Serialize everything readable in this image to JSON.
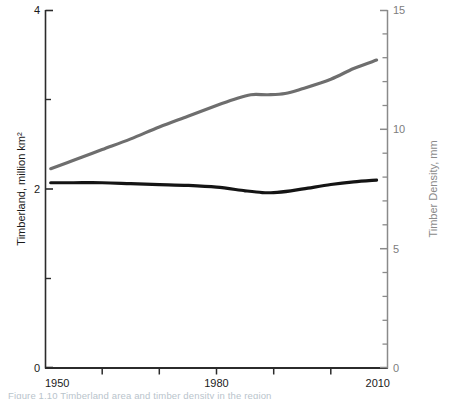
{
  "chart_data": {
    "type": "line",
    "title": "",
    "subtitle": "",
    "xlabel": "",
    "ylabel": "Timberland, million km²",
    "y2label": "Timber Density, mm",
    "xlim": [
      1950,
      2010
    ],
    "ylim": [
      0,
      4
    ],
    "y2lim": [
      0,
      15
    ],
    "grid": false,
    "legend": "none",
    "x_ticks_major": [
      1950,
      1980,
      2010
    ],
    "x_ticks_minor": [
      1960,
      1970,
      1990,
      2000
    ],
    "x_tick_labels": [
      "1950",
      "1980",
      "2010"
    ],
    "y_ticks_major": [
      0,
      2,
      4
    ],
    "y_ticks_minor": [
      1,
      3
    ],
    "y_tick_labels": [
      "0",
      "2",
      "4"
    ],
    "y2_ticks_major": [
      0,
      5,
      10,
      15
    ],
    "y2_ticks_minor": [
      1,
      2,
      3,
      4,
      6,
      7,
      8,
      9,
      11,
      12,
      13,
      14
    ],
    "y2_tick_labels": [
      "0",
      "5",
      "10",
      "15"
    ],
    "series": [
      {
        "name": "Timberland, million km²",
        "axis": "left",
        "color": "#141414",
        "width": 3.2,
        "x": [
          1951,
          1955,
          1960,
          1965,
          1970,
          1975,
          1980,
          1985,
          1988,
          1990,
          1993,
          1996,
          2000,
          2004,
          2008
        ],
        "values": [
          2.07,
          2.07,
          2.07,
          2.06,
          2.05,
          2.04,
          2.02,
          1.98,
          1.96,
          1.96,
          1.98,
          2.01,
          2.05,
          2.08,
          2.1
        ]
      },
      {
        "name": "Timber Density, mm",
        "axis": "right",
        "color": "#6e6e6e",
        "width": 3.2,
        "x": [
          1951,
          1955,
          1960,
          1965,
          1970,
          1975,
          1980,
          1983,
          1986,
          1989,
          1992,
          1995,
          2000,
          2004,
          2008
        ],
        "values": [
          8.35,
          8.7,
          9.15,
          9.6,
          10.1,
          10.55,
          11.0,
          11.25,
          11.45,
          11.45,
          11.5,
          11.7,
          12.1,
          12.55,
          12.9
        ]
      }
    ]
  },
  "axes": {
    "left_title": "Timberland, million km²",
    "right_title": "Timber Density, mm",
    "x_label_start": "1950",
    "x_label_mid": "1980",
    "x_label_end": "2010",
    "left_tick_0": "0",
    "left_tick_2": "2",
    "left_tick_4": "4",
    "right_tick_0": "0",
    "right_tick_5": "5",
    "right_tick_10": "10",
    "right_tick_15": "15"
  },
  "caption": {
    "text": "Figure 1.10  Timberland area and timber density in the region"
  },
  "colors": {
    "timberland_line": "#141414",
    "density_line": "#6e6e6e",
    "axis_left": "#2b2b2b",
    "axis_right": "#8a8a8a",
    "caption": "#b9c4cc"
  }
}
